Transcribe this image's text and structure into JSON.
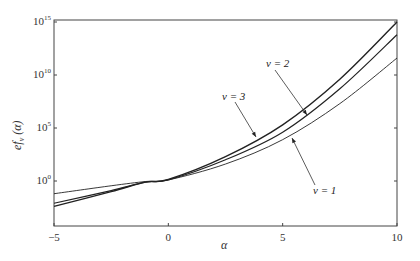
{
  "chart_data": {
    "type": "line",
    "title": "",
    "xlabel": "α",
    "ylabel": "ef_v(α)",
    "xlim": [
      -5,
      10
    ],
    "ylim_log10": [
      -3,
      15
    ],
    "yscale": "log",
    "grid": false,
    "legend": "none (inline annotations with arrows)",
    "x_ticks": [
      "-5",
      "0",
      "5",
      "10"
    ],
    "y_ticks": [
      {
        "base": "10",
        "exp": "0"
      },
      {
        "base": "10",
        "exp": "5"
      },
      {
        "base": "10",
        "exp": "10"
      },
      {
        "base": "10",
        "exp": "15"
      }
    ],
    "x": [
      -5,
      -2.5,
      -1,
      0,
      2.5,
      5,
      7.5,
      10
    ],
    "series": [
      {
        "name": "v = 1",
        "log10_values": [
          -1.2,
          -0.45,
          -0.05,
          0.1,
          1.6,
          3.9,
          7.3,
          11.6
        ]
      },
      {
        "name": "v = 2",
        "log10_values": [
          -2.1,
          -0.9,
          -0.1,
          0.1,
          2.0,
          4.6,
          8.7,
          13.8
        ]
      },
      {
        "name": "v = 3",
        "log10_values": [
          -2.4,
          -1.0,
          -0.1,
          0.15,
          2.3,
          5.3,
          9.6,
          15.0
        ]
      }
    ],
    "annotations": [
      {
        "text": "v = 1",
        "arrow_to_series": "v = 1"
      },
      {
        "text": "v = 2",
        "arrow_to_series": "v = 2"
      },
      {
        "text": "v = 3",
        "arrow_to_series": "v = 3"
      }
    ]
  },
  "labels": {
    "x_axis": "α",
    "y_axis_main": "ef",
    "y_axis_sub": "v",
    "y_axis_arg": "(α)",
    "ann_v1": "v = 1",
    "ann_v2": "v = 2",
    "ann_v3": "v = 3"
  }
}
